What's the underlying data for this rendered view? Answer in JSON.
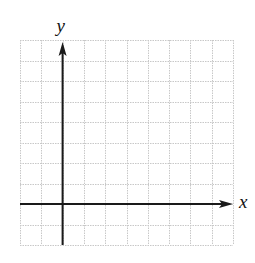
{
  "diagram": {
    "type": "coordinate-grid",
    "grid": {
      "left": 20,
      "top": 40,
      "right": 233,
      "bottom": 245,
      "columns": 10,
      "rows": 10,
      "line_color": "#c8c8c8",
      "line_style": "dotted"
    },
    "axes": {
      "color": "#1a1a1a",
      "y_axis_column": 2,
      "x_axis_row": 8,
      "x_label": "x",
      "y_label": "y"
    }
  }
}
